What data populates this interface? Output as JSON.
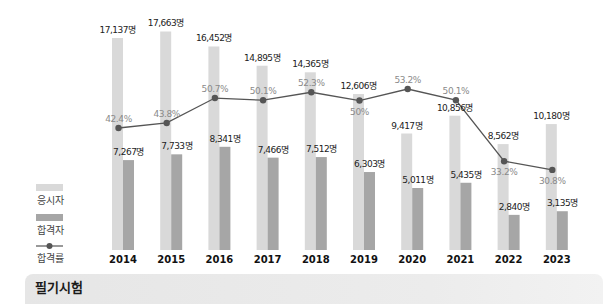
{
  "chart_data": {
    "type": "bar",
    "title": "필기시험",
    "xlabel": "",
    "ylabel": "",
    "categories": [
      "2014",
      "2015",
      "2016",
      "2017",
      "2018",
      "2019",
      "2020",
      "2021",
      "2022",
      "2023"
    ],
    "series": [
      {
        "name": "응시자",
        "type": "bar",
        "color": "#d9d9d9",
        "values": [
          17137,
          17663,
          16452,
          14895,
          14365,
          12606,
          9417,
          10856,
          8562,
          10180
        ],
        "labels": [
          "17,137명",
          "17,663명",
          "16,452명",
          "14,895명",
          "14,365명",
          "12,606명",
          "9,417명",
          "10,856명",
          "8,562명",
          "10,180명"
        ]
      },
      {
        "name": "합격자",
        "type": "bar",
        "color": "#a6a6a6",
        "values": [
          7267,
          7733,
          8341,
          7466,
          7512,
          6303,
          5011,
          5435,
          2840,
          3135
        ],
        "labels": [
          "7,267명",
          "7,733명",
          "8,341명",
          "7,466명",
          "7,512명",
          "6,303명",
          "5,011명",
          "5,435명",
          "2,840명",
          "3,135명"
        ]
      },
      {
        "name": "합격률",
        "type": "line",
        "color": "#555555",
        "values": [
          42.4,
          43.8,
          50.7,
          50.1,
          52.3,
          50,
          53.2,
          50.1,
          33.2,
          30.8
        ],
        "labels": [
          "42.4%",
          "43.8%",
          "50.7%",
          "50.1%",
          "52.3%",
          "50%",
          "53.2%",
          "50.1%",
          "33.2%",
          "30.8%"
        ]
      }
    ],
    "legend": {
      "position": "left",
      "entries": [
        "응시자",
        "합격자",
        "합격률"
      ]
    },
    "grid": false
  },
  "banner": {
    "title": "필기시험"
  },
  "legend": {
    "applicants": "응시자",
    "passers": "합격자",
    "pass_rate": "합격률"
  }
}
